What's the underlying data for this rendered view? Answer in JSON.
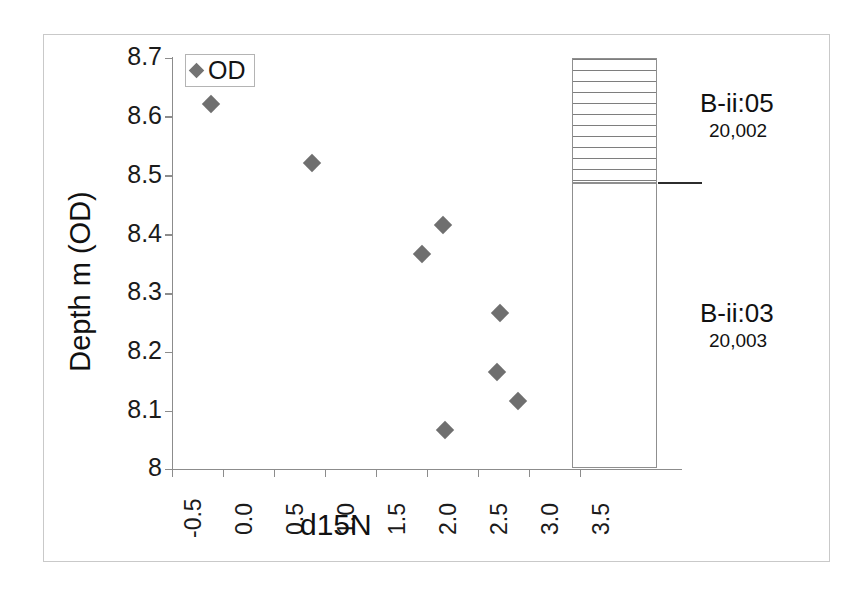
{
  "figure": {
    "background": "#ffffff",
    "frame_color": "#c9c9c9",
    "marker_color": "#6f6f6f",
    "axis_color": "#8c8c8c"
  },
  "legend": {
    "entries": [
      {
        "label": "OD",
        "marker": "diamond-marker",
        "color": "#737373"
      }
    ]
  },
  "axes": {
    "xlabel": "d15N",
    "ylabel": "Depth m (OD)",
    "xticks": [
      "-0.5",
      "0.0",
      "0.5",
      "1.0",
      "1.5",
      "2.0",
      "2.5",
      "3.0",
      "3.5"
    ],
    "yticks": [
      "8.7",
      "8.6",
      "8.5",
      "8.4",
      "8.3",
      "8.2",
      "8.1",
      "8"
    ]
  },
  "lithology": {
    "segments": [
      {
        "name": "B-ii:05",
        "code": "20,002",
        "pattern": "horizontal-lines",
        "top_depth": 8.7,
        "base_depth": 8.49
      },
      {
        "name": "B-ii:03",
        "code": "20,003",
        "pattern": "vertical-stipple",
        "top_depth": 8.49,
        "base_depth": 8.0
      }
    ],
    "boundary_depth": "8.49"
  },
  "chart_data": {
    "type": "scatter",
    "title": "",
    "xlabel": "d15N",
    "ylabel": "Depth m (OD)",
    "xlim": [
      -0.5,
      3.5
    ],
    "ylim": [
      8.0,
      8.7
    ],
    "xticks": [
      -0.5,
      0.0,
      0.5,
      1.0,
      1.5,
      2.0,
      2.5,
      3.0,
      3.5
    ],
    "yticks": [
      8.0,
      8.1,
      8.2,
      8.3,
      8.4,
      8.5,
      8.6,
      8.7
    ],
    "grid": false,
    "legend_position": "top-left",
    "series": [
      {
        "name": "OD",
        "marker": "diamond",
        "color": "#6f6f6f",
        "points": [
          {
            "x": -0.11,
            "y": 8.62
          },
          {
            "x": 0.88,
            "y": 8.52
          },
          {
            "x": 2.16,
            "y": 8.415
          },
          {
            "x": 1.96,
            "y": 8.365
          },
          {
            "x": 2.72,
            "y": 8.265
          },
          {
            "x": 2.69,
            "y": 8.165
          },
          {
            "x": 2.9,
            "y": 8.115
          },
          {
            "x": 2.18,
            "y": 8.065
          }
        ]
      }
    ]
  }
}
